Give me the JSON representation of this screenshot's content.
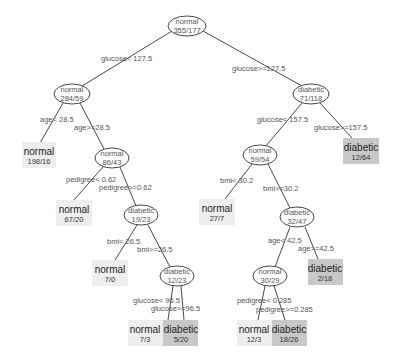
{
  "colors": {
    "leaf_normal": "#eeeeee",
    "leaf_diabetic": "#c8c8c8",
    "edge": "#333333",
    "text": "#555555"
  },
  "tree": {
    "root": {
      "class": "normal",
      "counts": "355/177"
    },
    "internal_nodes": [
      {
        "id": "n284",
        "class": "normal",
        "counts": "284/59"
      },
      {
        "id": "n71",
        "class": "diabetic",
        "counts": "71/118"
      },
      {
        "id": "n86",
        "class": "normal",
        "counts": "86/43"
      },
      {
        "id": "n59",
        "class": "normal",
        "counts": "59/54"
      },
      {
        "id": "n19",
        "class": "diabetic",
        "counts": "19/23"
      },
      {
        "id": "n32",
        "class": "diabetic",
        "counts": "32/47"
      },
      {
        "id": "n12",
        "class": "diabetic",
        "counts": "12/23"
      },
      {
        "id": "n30",
        "class": "normal",
        "counts": "30/29"
      }
    ],
    "leaves": [
      {
        "id": "l198",
        "class": "normal",
        "counts": "198/16"
      },
      {
        "id": "l12_64",
        "class": "diabetic",
        "counts": "12/64"
      },
      {
        "id": "l67",
        "class": "normal",
        "counts": "67/20"
      },
      {
        "id": "l27",
        "class": "normal",
        "counts": "27/7"
      },
      {
        "id": "l7_0",
        "class": "normal",
        "counts": "7/0"
      },
      {
        "id": "l2_18",
        "class": "diabetic",
        "counts": "2/18"
      },
      {
        "id": "l7_3",
        "class": "normal",
        "counts": "7/3"
      },
      {
        "id": "l5_20",
        "class": "diabetic",
        "counts": "5/20"
      },
      {
        "id": "l12_3",
        "class": "normal",
        "counts": "12/3"
      },
      {
        "id": "l18_26",
        "class": "diabetic",
        "counts": "18/26"
      }
    ],
    "splits": [
      {
        "label": "glucose< 127.5"
      },
      {
        "label": "glucose>=127.5"
      },
      {
        "label": "age< 28.5"
      },
      {
        "label": "age>=28.5"
      },
      {
        "label": "glucose< 157.5"
      },
      {
        "label": "glucose>=157.5"
      },
      {
        "label": "pedigree< 0.62"
      },
      {
        "label": "pedigree>=0.62"
      },
      {
        "label": "bmi< 30.2"
      },
      {
        "label": "bmi>=30.2"
      },
      {
        "label": "bmi< 26.5"
      },
      {
        "label": "bmi>=26.5"
      },
      {
        "label": "age< 42.5"
      },
      {
        "label": "age>=42.5"
      },
      {
        "label": "glucose< 96.5"
      },
      {
        "label": "glucose>=96.5"
      },
      {
        "label": "pedigree< 0.285"
      },
      {
        "label": "pedigree>=0.285"
      }
    ]
  }
}
